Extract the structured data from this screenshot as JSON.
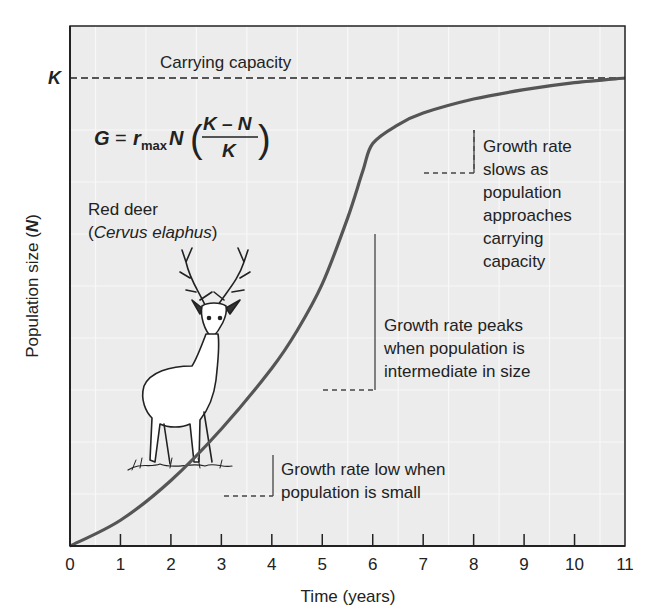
{
  "chart_data": {
    "type": "line",
    "title": "",
    "xlabel": "Time (years)",
    "ylabel": "Population size (N)",
    "ylabel_parts": {
      "text": "Population size (",
      "var": "N",
      "close": ")"
    },
    "x_ticks": [
      "0",
      "1",
      "2",
      "3",
      "4",
      "5",
      "6",
      "7",
      "8",
      "9",
      "10",
      "11"
    ],
    "xlim": [
      0,
      11
    ],
    "ylim": [
      0,
      1
    ],
    "grid": true,
    "series": [
      {
        "name": "Logistic population growth",
        "x": [
          0,
          1,
          2,
          3,
          4,
          4.5,
          5,
          5.5,
          5.8,
          6,
          6.5,
          7,
          8,
          9,
          10,
          11
        ],
        "values": [
          0.0,
          0.055,
          0.14,
          0.25,
          0.38,
          0.46,
          0.56,
          0.7,
          0.8,
          0.86,
          0.9,
          0.925,
          0.955,
          0.975,
          0.99,
          1.0
        ]
      }
    ],
    "reference_lines": [
      {
        "label": "Carrying capacity",
        "axis_label": "K",
        "y": 1.0,
        "style": "dashed"
      }
    ],
    "equation": {
      "lhs": "G",
      "eq": "=",
      "r": "r",
      "sub": "max",
      "n": "N",
      "numerator": "K – N",
      "denominator": "K"
    },
    "species_label": {
      "common": "Red deer",
      "scientific": "Cervus elaphus"
    },
    "annotations": [
      {
        "lines": [
          "Growth rate",
          "slows as",
          "population",
          "approaches",
          "carrying",
          "capacity"
        ],
        "x_range": [
          7,
          8
        ]
      },
      {
        "lines": [
          "Growth rate peaks",
          "when population is",
          "intermediate in size"
        ],
        "x_range": [
          5,
          6
        ]
      },
      {
        "lines": [
          "Growth rate low when",
          "population is small"
        ],
        "x_range": [
          3,
          4
        ]
      }
    ]
  },
  "colors": {
    "plot_bg": "#ececec",
    "curve": "#555555",
    "axis": "#222222",
    "grid": "#f8f8f8",
    "dash": "#555555"
  }
}
